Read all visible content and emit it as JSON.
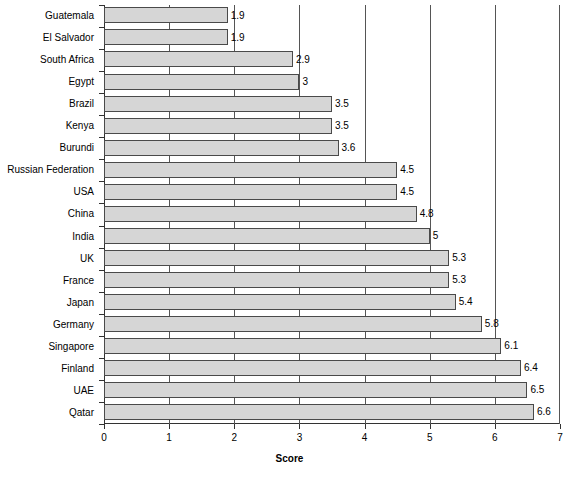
{
  "chart_data": {
    "type": "bar",
    "orientation": "horizontal",
    "title": "",
    "xlabel": "Score",
    "ylabel": "",
    "xlim": [
      0,
      7
    ],
    "xticks": [
      "0",
      "1",
      "2",
      "3",
      "4",
      "5",
      "6",
      "7"
    ],
    "grid": "vertical",
    "legend": "none",
    "categories": [
      "Guatemala",
      "El Salvador",
      "South Africa",
      "Egypt",
      "Brazil",
      "Kenya",
      "Burundi",
      "Russian Federation",
      "USA",
      "China",
      "India",
      "UK",
      "France",
      "Japan",
      "Germany",
      "Singapore",
      "Finland",
      "UAE",
      "Qatar"
    ],
    "values": [
      1.9,
      1.9,
      2.9,
      3,
      3.5,
      3.5,
      3.6,
      4.5,
      4.5,
      4.8,
      5,
      5.3,
      5.3,
      5.4,
      5.8,
      6.1,
      6.4,
      6.5,
      6.6
    ],
    "value_labels": [
      "1.9",
      "1.9",
      "2.9",
      "3",
      "3.5",
      "3.5",
      "3.6",
      "4.5",
      "4.5",
      "4.8",
      "5",
      "5.3",
      "5.3",
      "5.4",
      "5.8",
      "6.1",
      "6.4",
      "6.5",
      "6.6"
    ],
    "colors": {
      "bar_fill": "#d6d6d6",
      "bar_border": "#4a4a4a",
      "axis": "#333333",
      "gridline": "#555555",
      "text": "#000000",
      "background": "#ffffff"
    }
  }
}
